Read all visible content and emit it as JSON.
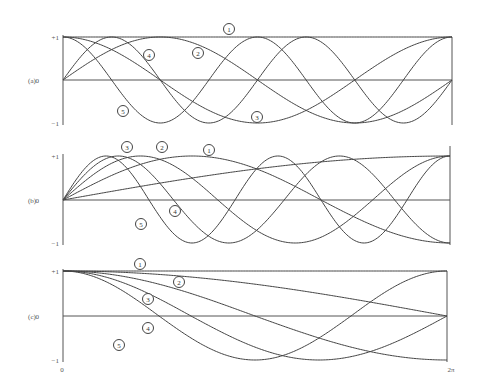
{
  "chart_data": [
    {
      "panel": "(a)",
      "type": "line",
      "title": "",
      "xlabel": "",
      "ylabel": "",
      "xlim": [
        0,
        6.2832
      ],
      "ylim": [
        -1,
        1
      ],
      "y_ticks": [
        "+1",
        "0",
        "−1"
      ],
      "grid": false,
      "series": [
        {
          "name": "1",
          "function": "1"
        },
        {
          "name": "2",
          "function": "sin x"
        },
        {
          "name": "3",
          "function": "cos x"
        },
        {
          "name": "4",
          "function": "sin 2x"
        },
        {
          "name": "5",
          "function": "cos 2x"
        }
      ]
    },
    {
      "panel": "(b)",
      "type": "line",
      "title": "",
      "xlabel": "",
      "ylabel": "",
      "xlim": [
        0,
        6.2832
      ],
      "ylim": [
        -1,
        1
      ],
      "y_ticks": [
        "+1",
        "0",
        "−1"
      ],
      "grid": false,
      "series": [
        {
          "name": "1",
          "function": "sin(x/4)"
        },
        {
          "name": "2",
          "function": "sin(3x/4)"
        },
        {
          "name": "3",
          "function": "sin(5x/4)"
        },
        {
          "name": "4",
          "function": "sin(7x/4)"
        },
        {
          "name": "5",
          "function": "sin(9x/4)"
        }
      ]
    },
    {
      "panel": "(c)",
      "type": "line",
      "title": "",
      "xlabel": "",
      "ylabel": "",
      "xlim": [
        0,
        6.2832
      ],
      "ylim": [
        -1,
        1
      ],
      "x_ticks": [
        "0",
        "2π"
      ],
      "y_ticks": [
        "+1",
        "0",
        "−1"
      ],
      "grid": false,
      "series": [
        {
          "name": "1",
          "function": "1"
        },
        {
          "name": "2",
          "function": "cos(x/4)"
        },
        {
          "name": "3",
          "function": "cos(x/2)"
        },
        {
          "name": "4",
          "function": "cos(3x/4)"
        },
        {
          "name": "5",
          "function": "cos x"
        }
      ]
    }
  ],
  "panels": [
    {
      "label": "(a)",
      "ytick_top": "+1",
      "ytick_mid": "0",
      "ytick_bot": "−1",
      "box": {
        "x0": 63,
        "x1": 452,
        "ytop": 37,
        "yzero": 80,
        "ybot": 123
      },
      "curves": [
        {
          "id": "1",
          "kind": "const",
          "k": 0
        },
        {
          "id": "2",
          "kind": "sin",
          "k": 1
        },
        {
          "id": "3",
          "kind": "cos",
          "k": 1
        },
        {
          "id": "4",
          "kind": "sin",
          "k": 2
        },
        {
          "id": "5",
          "kind": "cos",
          "k": 2
        }
      ],
      "badges": [
        {
          "text": "1",
          "x": 229,
          "y": 29
        },
        {
          "text": "2",
          "x": 198,
          "y": 53
        },
        {
          "text": "3",
          "x": 257,
          "y": 117
        },
        {
          "text": "4",
          "x": 149,
          "y": 55
        },
        {
          "text": "5",
          "x": 123,
          "y": 111
        }
      ],
      "right_axis": true
    },
    {
      "label": "(b)",
      "ytick_top": "+1",
      "ytick_mid": "0",
      "ytick_bot": "−1",
      "box": {
        "x0": 63,
        "x1": 450,
        "ytop": 156,
        "yzero": 200,
        "ybot": 243
      },
      "curves": [
        {
          "id": "1",
          "kind": "sin",
          "k": 0.25
        },
        {
          "id": "2",
          "kind": "sin",
          "k": 0.75
        },
        {
          "id": "3",
          "kind": "sin",
          "k": 1.25
        },
        {
          "id": "4",
          "kind": "sin",
          "k": 1.75
        },
        {
          "id": "5",
          "kind": "sin",
          "k": 2.25
        }
      ],
      "badges": [
        {
          "text": "3",
          "x": 127,
          "y": 147
        },
        {
          "text": "2",
          "x": 162,
          "y": 147
        },
        {
          "text": "1",
          "x": 209,
          "y": 150
        },
        {
          "text": "4",
          "x": 175,
          "y": 211
        },
        {
          "text": "5",
          "x": 141,
          "y": 224
        }
      ],
      "right_axis": true
    },
    {
      "label": "(c)",
      "ytick_top": "+1",
      "ytick_mid": "0",
      "ytick_bot": "−1",
      "xtick_left": "0",
      "xtick_right": "2π",
      "box": {
        "x0": 63,
        "x1": 447,
        "ytop": 271,
        "yzero": 316,
        "ybot": 360
      },
      "curves": [
        {
          "id": "1",
          "kind": "const",
          "k": 0
        },
        {
          "id": "2",
          "kind": "cos",
          "k": 0.25
        },
        {
          "id": "3",
          "kind": "cos",
          "k": 0.5
        },
        {
          "id": "4",
          "kind": "cos",
          "k": 0.75
        },
        {
          "id": "5",
          "kind": "cos",
          "k": 1
        }
      ],
      "badges": [
        {
          "text": "1",
          "x": 140,
          "y": 264
        },
        {
          "text": "2",
          "x": 179,
          "y": 282
        },
        {
          "text": "3",
          "x": 148,
          "y": 299
        },
        {
          "text": "4",
          "x": 148,
          "y": 328
        },
        {
          "text": "5",
          "x": 119,
          "y": 345
        }
      ],
      "right_axis": true
    }
  ]
}
